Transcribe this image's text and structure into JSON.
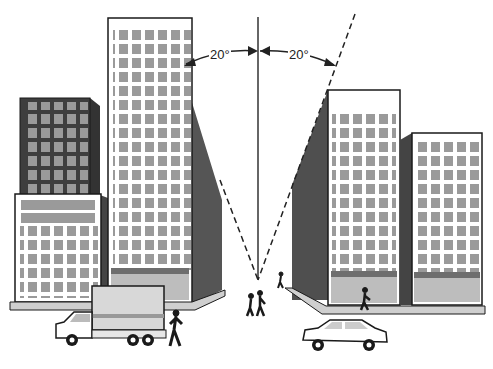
{
  "diagram": {
    "angles": [
      {
        "side": "left",
        "label": "20°"
      },
      {
        "side": "right",
        "label": "20°"
      }
    ],
    "colors": {
      "outline": "#1a1a1a",
      "window": "#9a9a9a",
      "dark_facade": "#4a4a4a",
      "side_shade": "#555555",
      "base": "#bdbdbd",
      "sidewalk": "#cfcfcf",
      "white": "#ffffff"
    },
    "elements": [
      "left-short-dark-tower",
      "left-low-building",
      "left-tall-setback-tower",
      "right-tall-tower",
      "right-mid-tower",
      "center-vertical-line",
      "left-sight-line",
      "right-sight-line",
      "truck",
      "car",
      "pedestrians"
    ]
  }
}
